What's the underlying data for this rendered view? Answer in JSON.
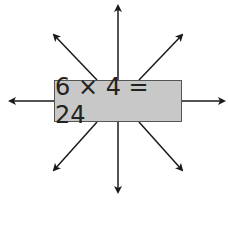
{
  "diagram": {
    "equation": "6 × 4 = 24",
    "box_color": "#c8c8c8",
    "border_color": "#555555",
    "arrow_color": "#1a1a1a",
    "arrows": [
      {
        "name": "arrow-up",
        "direction": "up"
      },
      {
        "name": "arrow-down",
        "direction": "down"
      },
      {
        "name": "arrow-left",
        "direction": "left"
      },
      {
        "name": "arrow-right",
        "direction": "right"
      },
      {
        "name": "arrow-up-left",
        "direction": "up-left"
      },
      {
        "name": "arrow-up-right",
        "direction": "up-right"
      },
      {
        "name": "arrow-down-left",
        "direction": "down-left"
      },
      {
        "name": "arrow-down-right",
        "direction": "down-right"
      }
    ]
  }
}
